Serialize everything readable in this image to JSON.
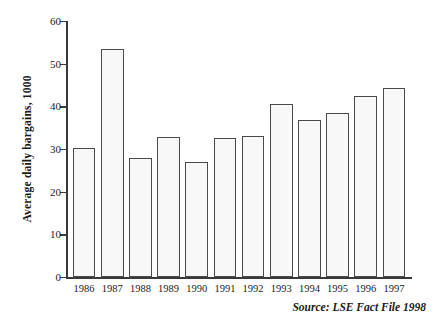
{
  "chart_data": {
    "type": "bar",
    "title": "",
    "subtitle": "",
    "xlabel": "",
    "ylabel": "Average daily bargains, 1000",
    "categories": [
      "1986",
      "1987",
      "1988",
      "1989",
      "1990",
      "1991",
      "1992",
      "1993",
      "1994",
      "1995",
      "1996",
      "1997"
    ],
    "values": [
      30.2,
      53.4,
      27.9,
      32.8,
      26.9,
      32.5,
      33.1,
      40.5,
      36.8,
      38.5,
      42.5,
      44.2
    ],
    "series": [
      {
        "name": "Average daily bargains",
        "values": [
          30.2,
          53.4,
          27.9,
          32.8,
          26.9,
          32.5,
          33.1,
          40.5,
          36.8,
          38.5,
          42.5,
          44.2
        ]
      }
    ],
    "ylim": [
      0,
      60
    ],
    "y_ticks": [
      0,
      10,
      20,
      30,
      40,
      50,
      60
    ],
    "y_tick_labels": [
      "0",
      "10",
      "20",
      "30",
      "40",
      "50",
      "60"
    ],
    "grid": false,
    "legend": null,
    "legend_position": "none",
    "annotations": [
      "Source: LSE Fact File 1998"
    ],
    "bar_fill_color": "#f8f8f8",
    "bar_border_color": "#4a4a4a",
    "axis_color": "#3a3a3a"
  },
  "source_note": "Source: LSE Fact File 1998"
}
